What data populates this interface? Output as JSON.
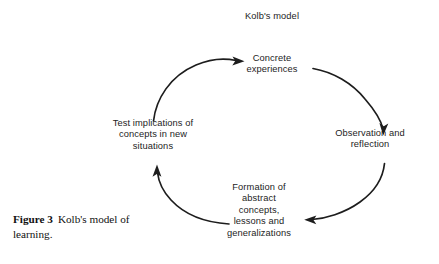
{
  "figure": {
    "background_color": "#ffffff",
    "ink_color": "#1d1d1d",
    "title": "Kolb's model",
    "caption": {
      "label": "Figure 3",
      "text": "Kolb's model of learning."
    },
    "nodes": [
      {
        "id": "concrete-experiences",
        "text": "Concrete\nexperiences",
        "position": "top"
      },
      {
        "id": "observation-and-reflection",
        "text": "Observation and\nreflection",
        "position": "right"
      },
      {
        "id": "formation-of-abstract-concepts",
        "text": "Formation of\nabstract\nconcepts,\nlessons and\ngeneralizations",
        "position": "bottom"
      },
      {
        "id": "test-implications",
        "text": "Test implications of\nconcepts in new\nsituations",
        "position": "left"
      }
    ],
    "arrows": [
      {
        "id": "arrow-test-to-concrete",
        "from": "test-implications",
        "to": "concrete-experiences",
        "direction": "clockwise-top-left"
      },
      {
        "id": "arrow-concrete-to-observation",
        "from": "concrete-experiences",
        "to": "observation-and-reflection",
        "direction": "clockwise-top-right"
      },
      {
        "id": "arrow-observation-to-formation",
        "from": "observation-and-reflection",
        "to": "formation-of-abstract-concepts",
        "direction": "clockwise-bottom-right"
      },
      {
        "id": "arrow-formation-to-test",
        "from": "formation-of-abstract-concepts",
        "to": "test-implications",
        "direction": "clockwise-bottom-left"
      }
    ]
  }
}
